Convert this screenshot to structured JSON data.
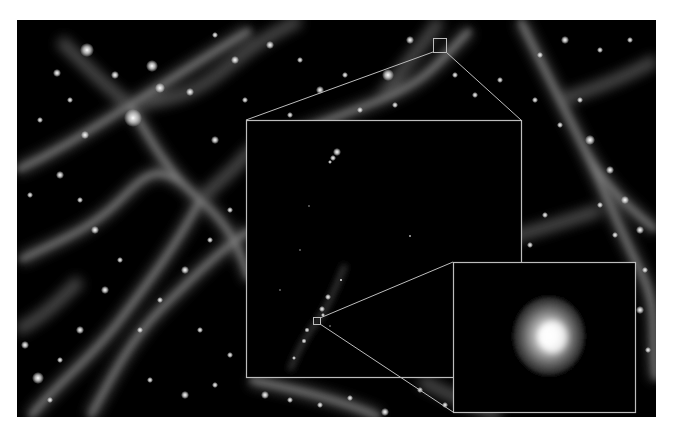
{
  "figure": {
    "background": "#ffffff",
    "frame_color": "#bdbdbd",
    "panel_color": "#000000"
  },
  "main_panel": {
    "x": 17,
    "y": 20,
    "width": 639,
    "height": 397
  },
  "zoom_box_1": {
    "x": 433,
    "y": 38,
    "width": 13,
    "height": 14
  },
  "inset_1": {
    "x": 246,
    "y": 120,
    "width": 275,
    "height": 257
  },
  "zoom_box_2": {
    "x": 313,
    "y": 317,
    "width": 7,
    "height": 7
  },
  "inset_2": {
    "x": 453,
    "y": 262,
    "width": 183,
    "height": 150
  },
  "halo": {
    "cx": 553,
    "cy": 337,
    "radius": 42,
    "core_radius": 12
  }
}
